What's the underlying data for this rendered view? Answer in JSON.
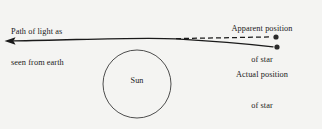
{
  "figure": {
    "background_color": "#f4f4f2",
    "ink_color": "#1a1a1a"
  },
  "labels": {
    "path_of_light": {
      "line1": "Path of light as",
      "line2": "seen from earth"
    },
    "apparent_position": {
      "line1": "Apparent position",
      "line2": "of star"
    },
    "actual_position": {
      "line1": "Actual position",
      "line2": "of star"
    },
    "sun": "Sun"
  },
  "elements": {
    "sun_circle": {
      "center_x": 137,
      "center_y": 84,
      "radius": 34,
      "stroke": "#3a3a3a"
    },
    "light_ray": {
      "style": "solid",
      "stroke": "#1a1a1a",
      "description": "curved light path bending around the Sun, arrowhead at left"
    },
    "sight_line": {
      "style": "dashed",
      "stroke": "#1a1a1a",
      "dash": "5 3",
      "description": "straight line of sight to apparent star position"
    },
    "apparent_star_dot": {
      "x": 276,
      "y": 37,
      "radius": 2.6
    },
    "actual_star_dot": {
      "x": 277,
      "y": 47,
      "radius": 2.6
    },
    "arrowhead": {
      "tip_x": 5,
      "tip_y": 41,
      "direction": "left"
    }
  }
}
